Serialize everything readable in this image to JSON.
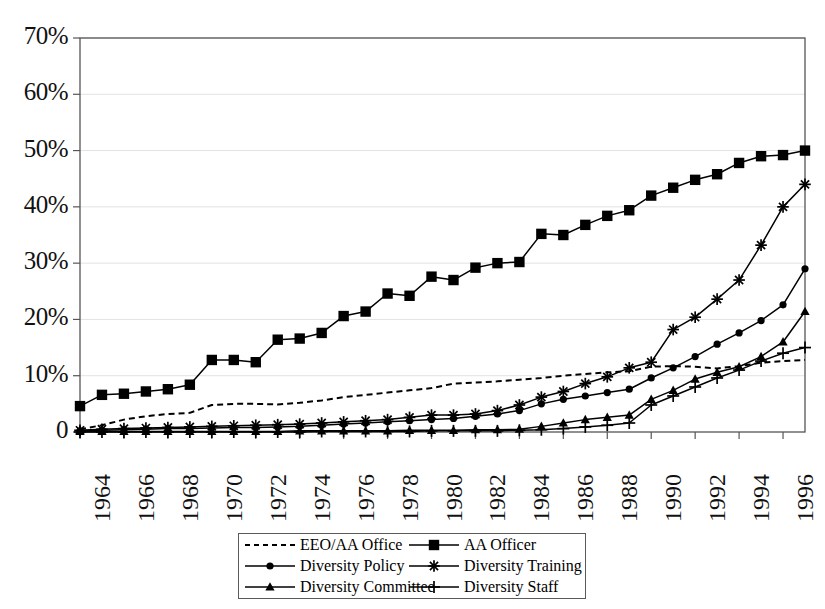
{
  "chart_data": {
    "type": "line",
    "title": "",
    "xlabel": "",
    "ylabel": "",
    "grid": true,
    "legend_position": "bottom-center",
    "xlim": [
      1964,
      1997
    ],
    "ylim": [
      0,
      70
    ],
    "ytick_labels": [
      "70%",
      "60%",
      "50%",
      "40%",
      "30%",
      "20%",
      "10%",
      "0"
    ],
    "ytick_values": [
      70,
      60,
      50,
      40,
      30,
      20,
      10,
      0
    ],
    "xtick_labels": [
      "1964",
      "1966",
      "1968",
      "1970",
      "1972",
      "1974",
      "1976",
      "1978",
      "1980",
      "1982",
      "1984",
      "1986",
      "1988",
      "1990",
      "1992",
      "1994",
      "1996"
    ],
    "xtick_values": [
      1964,
      1966,
      1968,
      1970,
      1972,
      1974,
      1976,
      1978,
      1980,
      1982,
      1984,
      1986,
      1988,
      1990,
      1992,
      1994,
      1996
    ],
    "x": [
      1964,
      1965,
      1966,
      1967,
      1968,
      1969,
      1970,
      1971,
      1972,
      1973,
      1974,
      1975,
      1976,
      1977,
      1978,
      1979,
      1980,
      1981,
      1982,
      1983,
      1984,
      1985,
      1986,
      1987,
      1988,
      1989,
      1990,
      1991,
      1992,
      1993,
      1994,
      1995,
      1996,
      1997
    ],
    "series": [
      {
        "name": "EEO/AA Office",
        "marker": "none",
        "dash": true,
        "values": [
          0.5,
          1.2,
          2.2,
          2.8,
          3.2,
          3.4,
          4.8,
          5.0,
          5.0,
          4.9,
          5.2,
          5.6,
          6.2,
          6.6,
          7.0,
          7.4,
          7.8,
          8.6,
          8.8,
          9.0,
          9.3,
          9.6,
          10.0,
          10.3,
          10.6,
          10.8,
          11.6,
          11.7,
          11.6,
          11.3,
          11.7,
          12.3,
          12.6,
          12.8
        ]
      },
      {
        "name": "AA Officer",
        "marker": "square",
        "dash": false,
        "values": [
          4.6,
          6.6,
          6.8,
          7.2,
          7.6,
          8.4,
          12.8,
          12.8,
          12.4,
          16.4,
          16.6,
          17.6,
          20.6,
          21.4,
          24.6,
          24.2,
          27.6,
          27.0,
          29.2,
          30.0,
          30.2,
          35.2,
          35.0,
          36.8,
          38.4,
          39.4,
          42.0,
          43.4,
          44.8,
          45.8,
          47.8,
          49.0,
          49.2,
          50.0
        ]
      },
      {
        "name": "Diversity Policy",
        "marker": "circle",
        "dash": false,
        "values": [
          0.2,
          0.3,
          0.4,
          0.5,
          0.6,
          0.6,
          0.7,
          0.8,
          0.8,
          0.9,
          1.0,
          1.2,
          1.4,
          1.6,
          1.8,
          2.0,
          2.2,
          2.4,
          2.8,
          3.2,
          3.8,
          5.0,
          5.8,
          6.4,
          7.0,
          7.6,
          9.6,
          11.4,
          13.4,
          15.6,
          17.6,
          19.8,
          22.6,
          29.0
        ]
      },
      {
        "name": "Diversity Training",
        "marker": "asterisk",
        "dash": false,
        "values": [
          0.3,
          0.5,
          0.6,
          0.7,
          0.8,
          0.9,
          1.0,
          1.1,
          1.2,
          1.3,
          1.4,
          1.6,
          1.8,
          2.0,
          2.2,
          2.6,
          3.0,
          3.0,
          3.2,
          3.8,
          4.8,
          6.2,
          7.2,
          8.6,
          9.8,
          11.4,
          12.4,
          18.2,
          20.4,
          23.6,
          27.0,
          33.2,
          40.0,
          44.0
        ]
      },
      {
        "name": "Diversity Committee",
        "marker": "triangle",
        "dash": false,
        "values": [
          0.1,
          0.1,
          0.1,
          0.1,
          0.1,
          0.1,
          0.1,
          0.1,
          0.1,
          0.1,
          0.2,
          0.2,
          0.2,
          0.2,
          0.2,
          0.3,
          0.3,
          0.3,
          0.4,
          0.4,
          0.5,
          1.0,
          1.6,
          2.2,
          2.6,
          3.0,
          5.8,
          7.4,
          9.4,
          10.6,
          11.6,
          13.4,
          16.0,
          21.4
        ]
      },
      {
        "name": "Diversity Staff",
        "marker": "plus",
        "dash": false,
        "values": [
          0.0,
          0.0,
          0.0,
          0.0,
          0.0,
          0.0,
          0.0,
          0.0,
          0.0,
          0.0,
          0.0,
          0.1,
          0.1,
          0.1,
          0.1,
          0.1,
          0.2,
          0.2,
          0.2,
          0.2,
          0.3,
          0.4,
          0.6,
          0.9,
          1.2,
          1.6,
          4.8,
          6.4,
          8.0,
          9.6,
          11.0,
          12.6,
          14.0,
          15.0
        ]
      }
    ]
  },
  "legend": {
    "entries": [
      {
        "label": "EEO/AA Office"
      },
      {
        "label": "AA Officer"
      },
      {
        "label": "Diversity Policy"
      },
      {
        "label": "Diversity Training"
      },
      {
        "label": "Diversity Committee"
      },
      {
        "label": "Diversity Staff"
      }
    ]
  },
  "colors": {
    "line": "#000000",
    "axis": "#555555",
    "grid": "#e2e2e2",
    "background": "#ffffff"
  }
}
